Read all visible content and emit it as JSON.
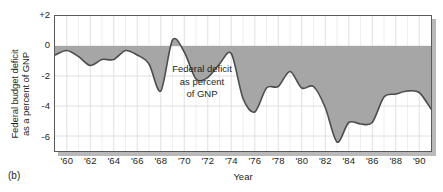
{
  "figure": {
    "panel_label": "(b)",
    "x_axis_title": "Year",
    "y_axis_title_line1": "Federal budget deficit",
    "y_axis_title_line2": "as a percent of GNP",
    "annotation_line1": "Federal deficit",
    "annotation_line2": "as percent",
    "annotation_line3": "of GNP"
  },
  "colors": {
    "fill": "#a6a6a6",
    "line": "#4d4d4f",
    "frame": "#58595b",
    "grid": "#d8d8d8",
    "shadow": "#b9b9b9",
    "text": "#231f20"
  },
  "chart_data": {
    "type": "area",
    "title": "",
    "subtitle": "",
    "xlabel": "Year",
    "ylabel": "Federal budget deficit as a percent of GNP",
    "annotation": "Federal deficit as percent of GNP",
    "xlim": [
      1959,
      1991
    ],
    "ylim": [
      -7,
      2
    ],
    "yticks": [
      2,
      0,
      -2,
      -4,
      -6
    ],
    "ytick_labels": [
      "+2",
      "0",
      "-2",
      "-4",
      "-6"
    ],
    "xticks": [
      1960,
      1962,
      1964,
      1966,
      1968,
      1970,
      1972,
      1974,
      1976,
      1978,
      1980,
      1982,
      1984,
      1986,
      1988,
      1990
    ],
    "xtick_labels": [
      "'60",
      "'62",
      "'64",
      "'66",
      "'68",
      "'70",
      "'72",
      "'74",
      "'76",
      "'78",
      "'80",
      "'82",
      "'84",
      "'86",
      "'88",
      "'90"
    ],
    "grid": true,
    "legend": "none",
    "baseline": 0,
    "fill_between_zero_and_series": true,
    "series": [
      {
        "name": "Federal deficit as percent of GNP",
        "x": [
          1959,
          1960,
          1961,
          1962,
          1963,
          1964,
          1965,
          1966,
          1967,
          1968,
          1969,
          1970,
          1971,
          1972,
          1973,
          1974,
          1975,
          1976,
          1977,
          1978,
          1979,
          1980,
          1981,
          1982,
          1983,
          1984,
          1985,
          1986,
          1987,
          1988,
          1989,
          1990,
          1991
        ],
        "values": [
          -0.6,
          -0.3,
          -0.7,
          -1.3,
          -0.9,
          -0.9,
          -0.3,
          -0.6,
          -1.2,
          -3.0,
          0.4,
          -0.4,
          -2.2,
          -2.1,
          -1.2,
          -0.5,
          -3.5,
          -4.4,
          -2.8,
          -2.7,
          -1.7,
          -2.8,
          -2.7,
          -4.1,
          -6.4,
          -5.1,
          -5.2,
          -5.1,
          -3.4,
          -3.2,
          -3.0,
          -3.1,
          -4.2
        ]
      }
    ]
  }
}
